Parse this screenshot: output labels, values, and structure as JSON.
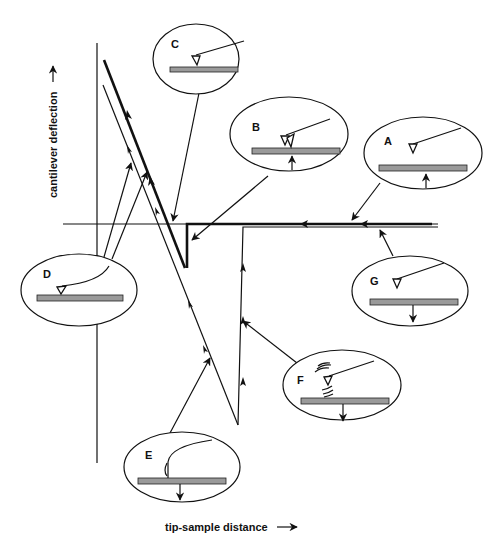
{
  "figure": {
    "x_axis_label": "tip-sample distance",
    "y_axis_label": "cantilever deflection",
    "x_axis_arrow": "right-arrow-icon",
    "y_axis_arrow": "up-arrow-icon"
  },
  "insets": [
    {
      "id": "A",
      "label": "A",
      "description": "tip above sample, sample moving up"
    },
    {
      "id": "B",
      "label": "B",
      "description": "tip snaps into contact, sample moving up"
    },
    {
      "id": "C",
      "label": "C",
      "description": "tip in contact"
    },
    {
      "id": "D",
      "label": "D",
      "description": "cantilever bent, tip adhered"
    },
    {
      "id": "E",
      "label": "E",
      "description": "cantilever bent down, sample moving down"
    },
    {
      "id": "F",
      "label": "F",
      "description": "tip released, cantilever oscillating, sample moving down"
    },
    {
      "id": "G",
      "label": "G",
      "description": "tip free, sample moving down"
    }
  ],
  "colors": {
    "ink": "#111111",
    "sample": "#9a9a9a",
    "background": "#ffffff"
  }
}
